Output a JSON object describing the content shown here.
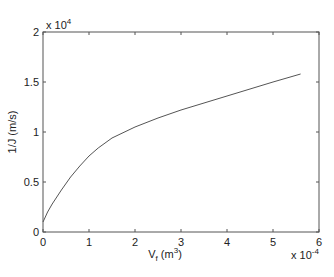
{
  "chart_data": {
    "type": "line",
    "title": "",
    "xlabel": "V_f (m^3)",
    "xlabel_main": "V",
    "xlabel_sub": "f",
    "xlabel_unit_pre": " (m",
    "xlabel_unit_sup": "3",
    "xlabel_unit_post": ")",
    "ylabel": "1/J (m/s)",
    "xlim": [
      0,
      6
    ],
    "ylim": [
      0,
      2
    ],
    "x_multiplier": "x 10",
    "x_multiplier_exp": "-4",
    "y_multiplier": "x 10",
    "y_multiplier_exp": "4",
    "x_ticks": [
      "0",
      "1",
      "2",
      "3",
      "4",
      "5",
      "6"
    ],
    "y_ticks": [
      "0",
      "0.5",
      "1",
      "1.5",
      "2"
    ],
    "grid": false,
    "series": [
      {
        "name": "1/J vs V_f",
        "color": "#555555",
        "x": [
          0,
          0.1,
          0.2,
          0.4,
          0.6,
          0.8,
          1.0,
          1.2,
          1.5,
          2.0,
          2.5,
          3.0,
          3.5,
          4.0,
          4.5,
          5.0,
          5.6
        ],
        "y": [
          0.1,
          0.2,
          0.28,
          0.42,
          0.55,
          0.66,
          0.76,
          0.84,
          0.94,
          1.05,
          1.14,
          1.22,
          1.29,
          1.36,
          1.43,
          1.5,
          1.58
        ]
      }
    ]
  }
}
